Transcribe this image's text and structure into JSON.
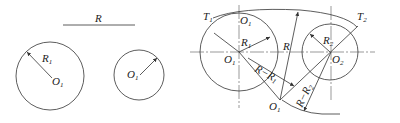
{
  "diagram": {
    "given": {
      "radius_label": "R",
      "circle1": {
        "center_label": "O",
        "center_sub": "1",
        "radius_label": "R",
        "radius_sub": "1"
      },
      "circle2": {
        "center_label": "O",
        "center_sub": "1"
      }
    },
    "construction": {
      "circle1": {
        "center_label": "O",
        "center_sub": "1",
        "radius_label": "R",
        "radius_sub": "1",
        "tangent_label": "T",
        "tangent_sub": "1",
        "top_label": "O",
        "top_sub": "1"
      },
      "circle2": {
        "center_label": "O",
        "center_sub": "2",
        "radius_label": "R",
        "radius_sub": "2",
        "tangent_label": "T",
        "tangent_sub": "2"
      },
      "arc_center": {
        "label": "O",
        "sub": "1"
      },
      "radius_label": "R",
      "diff1_label": "R−R",
      "diff1_sub": "1",
      "diff2_label": "R−R",
      "diff2_sub": "2"
    },
    "colors": {
      "line": "#333333",
      "axis": "#555555",
      "background": "#ffffff"
    }
  }
}
